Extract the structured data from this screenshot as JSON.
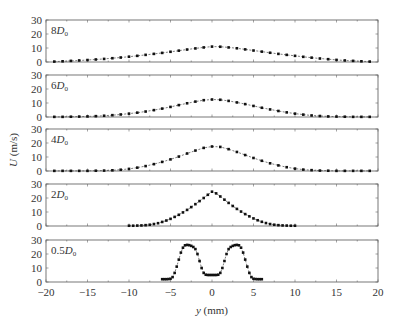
{
  "chart_data": {
    "type": "line",
    "title": "",
    "xlabel": "y (mm)",
    "ylabel": "U (m/s)",
    "xlim": [
      -20,
      20
    ],
    "ylim": [
      0,
      30
    ],
    "x_ticks": [
      -20,
      -15,
      -10,
      -5,
      0,
      5,
      10,
      15,
      20
    ],
    "y_ticks": [
      0,
      10,
      20,
      30
    ],
    "grid": false,
    "legend": "none",
    "panels": [
      {
        "name": "8D0",
        "label_main": "8D",
        "label_sub": "0",
        "x": [
          -19,
          -18,
          -17,
          -16,
          -15,
          -14,
          -13,
          -12,
          -11,
          -10,
          -9,
          -8,
          -7,
          -6,
          -5,
          -4,
          -3,
          -2,
          -1,
          0,
          1,
          2,
          3,
          4,
          5,
          6,
          7,
          8,
          9,
          10,
          11,
          12,
          13,
          14,
          15,
          16,
          17,
          18,
          19
        ],
        "values": [
          0.3,
          0.5,
          0.8,
          1.1,
          1.4,
          1.8,
          2.2,
          2.7,
          3.2,
          3.8,
          4.4,
          5.1,
          5.8,
          6.5,
          7.3,
          8.1,
          8.9,
          9.7,
          10.4,
          11.0,
          10.9,
          10.4,
          9.8,
          9.0,
          8.2,
          7.4,
          6.6,
          5.8,
          5.1,
          4.4,
          3.7,
          3.1,
          2.5,
          2.0,
          1.5,
          1.1,
          0.8,
          0.5,
          0.3
        ]
      },
      {
        "name": "6D0",
        "label_main": "6D",
        "label_sub": "0",
        "x": [
          -19,
          -18,
          -17,
          -16,
          -15,
          -14,
          -13,
          -12,
          -11,
          -10,
          -9,
          -8,
          -7,
          -6,
          -5,
          -4,
          -3,
          -2,
          -1,
          0,
          1,
          2,
          3,
          4,
          5,
          6,
          7,
          8,
          9,
          10,
          11,
          12,
          13,
          14,
          15,
          16,
          17,
          18,
          19
        ],
        "values": [
          0.1,
          0.1,
          0.2,
          0.3,
          0.4,
          0.6,
          0.9,
          1.3,
          1.8,
          2.4,
          3.1,
          3.9,
          4.9,
          6.0,
          7.2,
          8.5,
          9.8,
          11.0,
          12.0,
          12.5,
          12.3,
          11.5,
          10.4,
          9.2,
          7.9,
          6.6,
          5.4,
          4.3,
          3.3,
          2.4,
          1.7,
          1.1,
          0.7,
          0.4,
          0.3,
          0.2,
          0.1,
          0.1,
          0.1
        ]
      },
      {
        "name": "4D0",
        "label_main": "4D",
        "label_sub": "0",
        "x": [
          -19,
          -18,
          -17,
          -16,
          -15,
          -14,
          -13,
          -12,
          -11,
          -10,
          -9,
          -8,
          -7,
          -6,
          -5,
          -4,
          -3,
          -2,
          -1,
          0,
          1,
          2,
          3,
          4,
          5,
          6,
          7,
          8,
          9,
          10,
          11,
          12,
          13,
          14,
          15,
          16,
          17,
          18,
          19
        ],
        "values": [
          0.1,
          0.1,
          0.1,
          0.1,
          0.1,
          0.2,
          0.3,
          0.5,
          0.9,
          1.5,
          2.4,
          3.5,
          4.9,
          6.5,
          8.3,
          10.3,
          12.5,
          14.6,
          16.5,
          17.5,
          17.2,
          15.6,
          13.6,
          11.4,
          9.3,
          7.3,
          5.5,
          4.0,
          2.7,
          1.7,
          1.0,
          0.6,
          0.3,
          0.2,
          0.1,
          0.1,
          0.1,
          0.1,
          0.1
        ]
      },
      {
        "name": "2D0",
        "label_main": "2D",
        "label_sub": "0",
        "x": [
          -10,
          -9.5,
          -9,
          -8.5,
          -8,
          -7.5,
          -7,
          -6.5,
          -6,
          -5.5,
          -5,
          -4.5,
          -4,
          -3.5,
          -3,
          -2.5,
          -2,
          -1.5,
          -1,
          -0.5,
          0,
          0.5,
          1,
          1.5,
          2,
          2.5,
          3,
          3.5,
          4,
          4.5,
          5,
          5.5,
          6,
          6.5,
          7,
          7.5,
          8,
          8.5,
          9,
          9.5,
          10
        ],
        "values": [
          0.2,
          0.2,
          0.3,
          0.4,
          0.6,
          0.9,
          1.4,
          2.0,
          2.9,
          3.9,
          5.1,
          6.5,
          8.0,
          9.7,
          11.5,
          13.5,
          15.6,
          17.8,
          20.0,
          22.3,
          24.5,
          23.3,
          21.1,
          18.8,
          16.5,
          14.3,
          12.2,
          10.3,
          8.5,
          6.9,
          5.4,
          4.1,
          3.0,
          2.1,
          1.4,
          0.9,
          0.6,
          0.4,
          0.3,
          0.2,
          0.2
        ]
      },
      {
        "name": "0.5D0",
        "label_main": "0.5D",
        "label_sub": "0",
        "x": [
          -6,
          -5.75,
          -5.5,
          -5.25,
          -5,
          -4.75,
          -4.5,
          -4.25,
          -4,
          -3.75,
          -3.5,
          -3.25,
          -3,
          -2.75,
          -2.5,
          -2.25,
          -2,
          -1.75,
          -1.5,
          -1.25,
          -1,
          -0.75,
          -0.5,
          -0.25,
          0,
          0.25,
          0.5,
          0.75,
          1,
          1.25,
          1.5,
          1.75,
          2,
          2.25,
          2.5,
          2.75,
          3,
          3.25,
          3.5,
          3.75,
          4,
          4.25,
          4.5,
          4.75,
          5,
          5.25,
          5.5,
          5.75,
          6
        ],
        "values": [
          2.0,
          2.0,
          2.0,
          2.1,
          2.3,
          3.5,
          6.5,
          11,
          16,
          21,
          24.5,
          26.2,
          26.5,
          26.3,
          25.8,
          25.0,
          23.5,
          20,
          15,
          10,
          6.5,
          5.2,
          5.0,
          5.0,
          5.0,
          5.0,
          5.0,
          5.2,
          6.5,
          10,
          15,
          20,
          23.5,
          25.0,
          25.8,
          26.3,
          26.5,
          26.2,
          24.5,
          21,
          16,
          11,
          6.5,
          3.5,
          2.3,
          2.1,
          2.0,
          2.0,
          2.0
        ]
      }
    ]
  },
  "axes": {
    "xlabel_italic": "y",
    "xlabel_unit": "(mm)",
    "ylabel_italic": "U",
    "ylabel_unit": "(m/s)"
  }
}
